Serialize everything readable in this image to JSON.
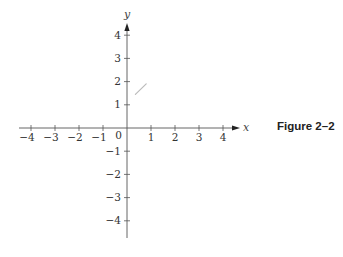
{
  "figure": {
    "caption": "Figure 2–2"
  },
  "chart_data": {
    "type": "line",
    "title": "",
    "xlabel": "x",
    "ylabel": "y",
    "xlim": [
      -4.5,
      4.6
    ],
    "ylim": [
      -4.6,
      4.5
    ],
    "grid": false,
    "legend": null,
    "x_ticks": [
      -4,
      -3,
      -2,
      -1,
      1,
      2,
      3,
      4
    ],
    "x_tick_labels": [
      "−4",
      "−3",
      "−2",
      "−1",
      "1",
      "2",
      "3",
      "4"
    ],
    "y_ticks": [
      4,
      3,
      2,
      1,
      -1,
      -2,
      -3,
      -4
    ],
    "y_tick_labels": [
      "4",
      "3",
      "2",
      "1",
      "−1",
      "−2",
      "−3",
      "−4"
    ],
    "origin_label": "0",
    "series": [
      {
        "name": "faint stroke",
        "x": [
          0.35,
          0.8
        ],
        "y": [
          1.45,
          1.9
        ],
        "color": "#bbbbbb"
      }
    ],
    "annotations": [
      "Figure 2–2"
    ]
  }
}
